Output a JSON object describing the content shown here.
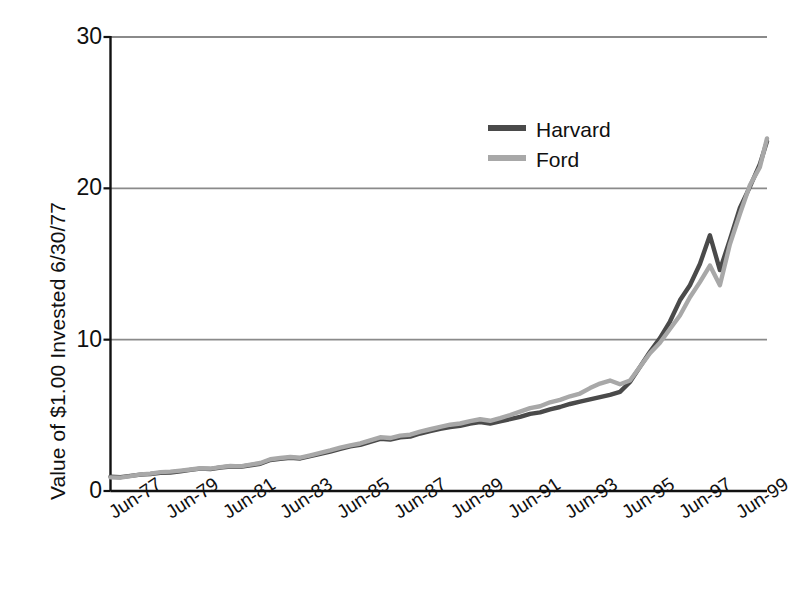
{
  "chart_data": {
    "type": "line",
    "title": "",
    "xlabel": "",
    "ylabel": "Value of $1.00 Invested 6/30/77",
    "ylim": [
      0,
      30
    ],
    "yticks": [
      0,
      10,
      20,
      30
    ],
    "ytick_labels": [
      "0",
      "10",
      "20",
      "30"
    ],
    "grid": true,
    "legend_position": "upper-center-right",
    "xtick_labels": [
      "Jun-77",
      "Jun-79",
      "Jun-81",
      "Jun-83",
      "Jun-85",
      "Jun-87",
      "Jun-89",
      "Jun-91",
      "Jun-93",
      "Jun-95",
      "Jun-97",
      "Jun-99"
    ],
    "x": [
      1977,
      1978,
      1979,
      1980,
      1981,
      1982,
      1983,
      1984,
      1985,
      1986,
      1987,
      1988,
      1989,
      1990,
      1991,
      1992,
      1993,
      1994,
      1995,
      1996,
      1997,
      1998,
      1999
    ],
    "x_labels_all": [
      "Jun-77",
      "Jun-78",
      "Jun-79",
      "Jun-80",
      "Jun-81",
      "Jun-82",
      "Jun-83",
      "Jun-84",
      "Jun-85",
      "Jun-86",
      "Jun-87",
      "Jun-88",
      "Jun-89",
      "Jun-90",
      "Jun-91",
      "Jun-92",
      "Jun-93",
      "Jun-94",
      "Jun-95",
      "Jun-96",
      "Jun-97",
      "Jun-98",
      "Jun-99"
    ],
    "series": [
      {
        "name": "Harvard",
        "color": "#4a4a4a",
        "values": [
          1.0,
          1.1,
          1.18,
          1.42,
          1.58,
          1.72,
          2.15,
          2.18,
          2.62,
          3.05,
          3.45,
          3.55,
          4.1,
          4.4,
          4.65,
          5.25,
          5.7,
          6.3,
          7.6,
          9.9,
          13.0,
          15.8,
          23.1
        ]
      },
      {
        "name": "Ford",
        "color": "#a8a8a8",
        "values": [
          1.0,
          1.12,
          1.22,
          1.45,
          1.62,
          1.78,
          2.2,
          2.25,
          2.7,
          3.15,
          3.55,
          3.7,
          4.25,
          4.62,
          5.05,
          5.7,
          6.3,
          6.85,
          7.7,
          9.6,
          12.3,
          15.0,
          23.3
        ]
      }
    ],
    "series_detailed": [
      {
        "name": "Harvard",
        "points": [
          {
            "t": 0.0,
            "v": 0.95
          },
          {
            "t": 0.35,
            "v": 0.92
          },
          {
            "t": 0.7,
            "v": 1.0
          },
          {
            "t": 1.05,
            "v": 1.08
          },
          {
            "t": 1.4,
            "v": 1.12
          },
          {
            "t": 1.75,
            "v": 1.2
          },
          {
            "t": 2.1,
            "v": 1.22
          },
          {
            "t": 2.45,
            "v": 1.3
          },
          {
            "t": 2.8,
            "v": 1.4
          },
          {
            "t": 3.15,
            "v": 1.48
          },
          {
            "t": 3.5,
            "v": 1.45
          },
          {
            "t": 3.85,
            "v": 1.55
          },
          {
            "t": 4.2,
            "v": 1.62
          },
          {
            "t": 4.55,
            "v": 1.6
          },
          {
            "t": 4.9,
            "v": 1.7
          },
          {
            "t": 5.25,
            "v": 1.8
          },
          {
            "t": 5.6,
            "v": 2.05
          },
          {
            "t": 5.95,
            "v": 2.12
          },
          {
            "t": 6.3,
            "v": 2.2
          },
          {
            "t": 6.65,
            "v": 2.15
          },
          {
            "t": 7.0,
            "v": 2.3
          },
          {
            "t": 7.35,
            "v": 2.45
          },
          {
            "t": 7.7,
            "v": 2.6
          },
          {
            "t": 8.05,
            "v": 2.78
          },
          {
            "t": 8.4,
            "v": 2.95
          },
          {
            "t": 8.75,
            "v": 3.05
          },
          {
            "t": 9.1,
            "v": 3.25
          },
          {
            "t": 9.45,
            "v": 3.45
          },
          {
            "t": 9.8,
            "v": 3.4
          },
          {
            "t": 10.15,
            "v": 3.55
          },
          {
            "t": 10.5,
            "v": 3.6
          },
          {
            "t": 10.85,
            "v": 3.8
          },
          {
            "t": 11.2,
            "v": 3.95
          },
          {
            "t": 11.55,
            "v": 4.1
          },
          {
            "t": 11.9,
            "v": 4.22
          },
          {
            "t": 12.25,
            "v": 4.3
          },
          {
            "t": 12.6,
            "v": 4.45
          },
          {
            "t": 12.95,
            "v": 4.55
          },
          {
            "t": 13.3,
            "v": 4.45
          },
          {
            "t": 13.65,
            "v": 4.6
          },
          {
            "t": 14.0,
            "v": 4.75
          },
          {
            "t": 14.35,
            "v": 4.9
          },
          {
            "t": 14.7,
            "v": 5.1
          },
          {
            "t": 15.05,
            "v": 5.2
          },
          {
            "t": 15.4,
            "v": 5.4
          },
          {
            "t": 15.75,
            "v": 5.55
          },
          {
            "t": 16.1,
            "v": 5.75
          },
          {
            "t": 16.45,
            "v": 5.9
          },
          {
            "t": 16.8,
            "v": 6.05
          },
          {
            "t": 17.15,
            "v": 6.2
          },
          {
            "t": 17.5,
            "v": 6.35
          },
          {
            "t": 17.85,
            "v": 6.55
          },
          {
            "t": 18.2,
            "v": 7.2
          },
          {
            "t": 18.55,
            "v": 8.2
          },
          {
            "t": 18.9,
            "v": 9.2
          },
          {
            "t": 19.25,
            "v": 10.1
          },
          {
            "t": 19.6,
            "v": 11.2
          },
          {
            "t": 19.95,
            "v": 12.6
          },
          {
            "t": 20.3,
            "v": 13.6
          },
          {
            "t": 20.65,
            "v": 15.0
          },
          {
            "t": 21.0,
            "v": 16.9
          },
          {
            "t": 21.35,
            "v": 14.6
          },
          {
            "t": 21.7,
            "v": 16.6
          },
          {
            "t": 22.05,
            "v": 18.7
          },
          {
            "t": 22.4,
            "v": 20.1
          },
          {
            "t": 22.75,
            "v": 21.6
          },
          {
            "t": 23.0,
            "v": 23.1
          }
        ]
      },
      {
        "name": "Ford",
        "points": [
          {
            "t": 0.0,
            "v": 0.9
          },
          {
            "t": 0.35,
            "v": 0.88
          },
          {
            "t": 0.7,
            "v": 0.98
          },
          {
            "t": 1.05,
            "v": 1.1
          },
          {
            "t": 1.4,
            "v": 1.15
          },
          {
            "t": 1.75,
            "v": 1.25
          },
          {
            "t": 2.1,
            "v": 1.28
          },
          {
            "t": 2.45,
            "v": 1.35
          },
          {
            "t": 2.8,
            "v": 1.42
          },
          {
            "t": 3.15,
            "v": 1.5
          },
          {
            "t": 3.5,
            "v": 1.48
          },
          {
            "t": 3.85,
            "v": 1.58
          },
          {
            "t": 4.2,
            "v": 1.65
          },
          {
            "t": 4.55,
            "v": 1.63
          },
          {
            "t": 4.9,
            "v": 1.74
          },
          {
            "t": 5.25,
            "v": 1.85
          },
          {
            "t": 5.6,
            "v": 2.1
          },
          {
            "t": 5.95,
            "v": 2.18
          },
          {
            "t": 6.3,
            "v": 2.25
          },
          {
            "t": 6.65,
            "v": 2.2
          },
          {
            "t": 7.0,
            "v": 2.36
          },
          {
            "t": 7.35,
            "v": 2.52
          },
          {
            "t": 7.7,
            "v": 2.68
          },
          {
            "t": 8.05,
            "v": 2.86
          },
          {
            "t": 8.4,
            "v": 3.02
          },
          {
            "t": 8.75,
            "v": 3.14
          },
          {
            "t": 9.1,
            "v": 3.34
          },
          {
            "t": 9.45,
            "v": 3.55
          },
          {
            "t": 9.8,
            "v": 3.5
          },
          {
            "t": 10.15,
            "v": 3.66
          },
          {
            "t": 10.5,
            "v": 3.72
          },
          {
            "t": 10.85,
            "v": 3.92
          },
          {
            "t": 11.2,
            "v": 4.08
          },
          {
            "t": 11.55,
            "v": 4.24
          },
          {
            "t": 11.9,
            "v": 4.38
          },
          {
            "t": 12.25,
            "v": 4.46
          },
          {
            "t": 12.6,
            "v": 4.62
          },
          {
            "t": 12.95,
            "v": 4.74
          },
          {
            "t": 13.3,
            "v": 4.64
          },
          {
            "t": 13.65,
            "v": 4.82
          },
          {
            "t": 14.0,
            "v": 5.02
          },
          {
            "t": 14.35,
            "v": 5.25
          },
          {
            "t": 14.7,
            "v": 5.48
          },
          {
            "t": 15.05,
            "v": 5.6
          },
          {
            "t": 15.4,
            "v": 5.86
          },
          {
            "t": 15.75,
            "v": 6.02
          },
          {
            "t": 16.1,
            "v": 6.26
          },
          {
            "t": 16.45,
            "v": 6.44
          },
          {
            "t": 16.8,
            "v": 6.8
          },
          {
            "t": 17.15,
            "v": 7.1
          },
          {
            "t": 17.5,
            "v": 7.3
          },
          {
            "t": 17.85,
            "v": 7.05
          },
          {
            "t": 18.2,
            "v": 7.3
          },
          {
            "t": 18.55,
            "v": 8.2
          },
          {
            "t": 18.9,
            "v": 9.1
          },
          {
            "t": 19.25,
            "v": 9.8
          },
          {
            "t": 19.6,
            "v": 10.7
          },
          {
            "t": 19.95,
            "v": 11.6
          },
          {
            "t": 20.3,
            "v": 12.8
          },
          {
            "t": 20.65,
            "v": 13.8
          },
          {
            "t": 21.0,
            "v": 14.9
          },
          {
            "t": 21.35,
            "v": 13.6
          },
          {
            "t": 21.7,
            "v": 16.3
          },
          {
            "t": 22.05,
            "v": 18.3
          },
          {
            "t": 22.4,
            "v": 20.2
          },
          {
            "t": 22.75,
            "v": 21.4
          },
          {
            "t": 23.0,
            "v": 23.3
          }
        ]
      }
    ]
  },
  "legend": {
    "items": [
      {
        "label": "Harvard",
        "color": "#4a4a4a"
      },
      {
        "label": "Ford",
        "color": "#a8a8a8"
      }
    ]
  },
  "axis": {
    "y_title": "Value of $1.00 Invested 6/30/77"
  }
}
